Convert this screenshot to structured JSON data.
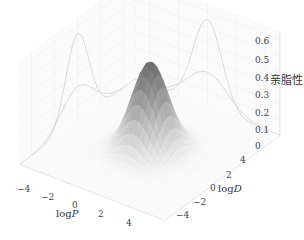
{
  "chart_data": {
    "type": "surface3d",
    "title": "",
    "xlabel": "logP",
    "ylabel": "logD",
    "zlabel": "亲脂性",
    "xlim": [
      -5,
      5
    ],
    "ylim": [
      -5,
      5
    ],
    "zlim": [
      0,
      0.65
    ],
    "x_ticks": [
      "−4",
      "−2",
      "0",
      "2",
      "4"
    ],
    "y_ticks": [
      "−4",
      "−2",
      "0",
      "2",
      "4"
    ],
    "z_ticks": [
      "0",
      "0.1",
      "0.2",
      "0.3",
      "0.4",
      "0.5",
      "0.6"
    ],
    "surface": {
      "function": "gaussian2d",
      "peak": 0.55,
      "center": [
        0,
        0
      ],
      "sigma": [
        1.0,
        1.0
      ],
      "colormap": "gray"
    },
    "projections": [
      {
        "wall": "x-back",
        "curves": [
          {
            "peak": 0.55,
            "sigma": 1.0
          },
          {
            "peak": 0.22,
            "sigma": 1.4
          }
        ]
      },
      {
        "wall": "y-back",
        "curves": [
          {
            "peak": 0.55,
            "sigma": 1.0
          },
          {
            "peak": 0.22,
            "sigma": 1.4
          }
        ]
      }
    ],
    "grid": true
  },
  "labels": {
    "x_axis": "log",
    "x_axis_var": "P",
    "y_axis": "log",
    "y_axis_var": "D",
    "z_axis": "亲脂性"
  }
}
